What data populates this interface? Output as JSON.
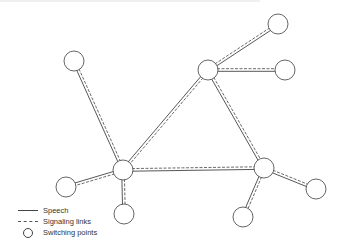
{
  "diagram": {
    "type": "network-topology",
    "nodes": [
      {
        "id": "n1",
        "role": "switching-point",
        "x": 74,
        "y": 61,
        "r": 10
      },
      {
        "id": "n2",
        "role": "switching-point",
        "x": 278,
        "y": 24,
        "r": 10
      },
      {
        "id": "n3",
        "role": "switching-point-hub",
        "x": 208,
        "y": 70,
        "r": 10
      },
      {
        "id": "n4",
        "role": "switching-point",
        "x": 285,
        "y": 70,
        "r": 10
      },
      {
        "id": "n5",
        "role": "switching-point-hub",
        "x": 123,
        "y": 170,
        "r": 10
      },
      {
        "id": "n6",
        "role": "switching-point",
        "x": 66,
        "y": 187,
        "r": 10
      },
      {
        "id": "n7",
        "role": "switching-point",
        "x": 124,
        "y": 214,
        "r": 10
      },
      {
        "id": "n8",
        "role": "switching-point-hub",
        "x": 264,
        "y": 168,
        "r": 10
      },
      {
        "id": "n9",
        "role": "switching-point",
        "x": 316,
        "y": 189,
        "r": 10
      },
      {
        "id": "n10",
        "role": "switching-point",
        "x": 243,
        "y": 217,
        "r": 10
      }
    ],
    "edges": [
      {
        "from": "n1",
        "to": "n5"
      },
      {
        "from": "n3",
        "to": "n2"
      },
      {
        "from": "n3",
        "to": "n4"
      },
      {
        "from": "n3",
        "to": "n5"
      },
      {
        "from": "n3",
        "to": "n8"
      },
      {
        "from": "n5",
        "to": "n8"
      },
      {
        "from": "n5",
        "to": "n6"
      },
      {
        "from": "n5",
        "to": "n7"
      },
      {
        "from": "n8",
        "to": "n9"
      },
      {
        "from": "n8",
        "to": "n10"
      }
    ],
    "colors": {
      "line": "#444444",
      "node_stroke": "#555555",
      "node_fill": "#ffffff"
    }
  },
  "legend": {
    "items": [
      {
        "symbol": "solid-line",
        "label": "Speech"
      },
      {
        "symbol": "dashed-line",
        "label": "Signaling links"
      },
      {
        "symbol": "circle",
        "label": "Switching points"
      }
    ]
  }
}
